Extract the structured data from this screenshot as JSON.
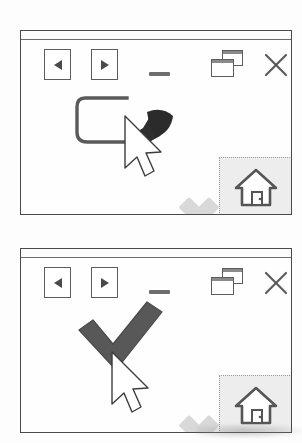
{
  "figure": {
    "caption": "",
    "panels": [
      {
        "id": "panel-in-progress",
        "state_label": "",
        "titlebar_text": "",
        "toolbar": {
          "back_label": "",
          "forward_label": "",
          "minimize_label": "",
          "restore_label": "",
          "close_label": ""
        },
        "gesture": {
          "name": "checkmark-stroke-partial",
          "complete": false,
          "stroke_color": "#4d4d4d",
          "cursor_visible": true,
          "cursor_label": ""
        },
        "ghost_target": {
          "name": "close-x-target",
          "label": "",
          "color": "#d8d8d8",
          "enabled": false
        },
        "home_button": {
          "label": "",
          "icon": "home-icon",
          "background": "#ededed"
        }
      },
      {
        "id": "panel-complete",
        "state_label": "",
        "titlebar_text": "",
        "toolbar": {
          "back_label": "",
          "forward_label": "",
          "minimize_label": "",
          "restore_label": "",
          "close_label": ""
        },
        "gesture": {
          "name": "checkmark-stroke-complete",
          "complete": true,
          "stroke_color": "#4d4d4d",
          "cursor_visible": true,
          "cursor_label": ""
        },
        "ghost_target": {
          "name": "close-x-target",
          "label": "",
          "color": "#d8d8d8",
          "enabled": false
        },
        "home_button": {
          "label": "",
          "icon": "home-icon",
          "background": "#ededed"
        }
      }
    ],
    "colors": {
      "window_border": "#4a4a4a",
      "icon_outline": "#5c5c5c",
      "stroke_dark": "#4d4d4d",
      "ghost_grey": "#d8d8d8",
      "home_panel_bg": "#ededed",
      "page_bg": "#fdfdfd"
    },
    "icons": {
      "back": "triangle-left-icon",
      "forward": "triangle-right-icon",
      "minimize": "minimize-dash-icon",
      "restore": "restore-windows-icon",
      "close": "close-x-icon",
      "home": "home-icon",
      "cursor": "mouse-pointer-icon",
      "check": "checkmark-icon",
      "ghost_x": "x-mark-icon"
    }
  }
}
